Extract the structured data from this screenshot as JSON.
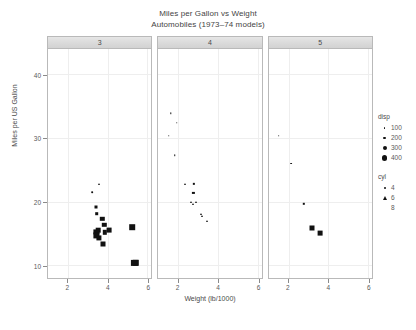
{
  "chart_data": {
    "type": "scatter",
    "title": "Miles per Gallon vs Weight",
    "subtitle": "Automobiles (1973–74 models)",
    "xlabel": "Weight (lb/1000)",
    "ylabel": "Miles per US Gallon",
    "xlim": [
      1.0,
      6.2
    ],
    "ylim": [
      8.0,
      44.0
    ],
    "xticks": [
      2,
      4,
      6
    ],
    "yticks": [
      0,
      10,
      20,
      30,
      40
    ],
    "grid": true,
    "facet_variable": "gear",
    "panels": [
      {
        "label": "3",
        "points": [
          {
            "x": 3.215,
            "y": 21.5,
            "cyl": 4,
            "disp": 120,
            "shape": "circle",
            "size": 1.7
          },
          {
            "x": 3.57,
            "y": 22.8,
            "cyl": 6,
            "disp": 141,
            "shape": "triangle",
            "size": 2.4
          },
          {
            "x": 3.44,
            "y": 19.2,
            "cyl": 6,
            "disp": 168,
            "shape": "square",
            "size": 3.0
          },
          {
            "x": 3.46,
            "y": 18.1,
            "cyl": 6,
            "disp": 225,
            "shape": "square",
            "size": 3.6
          },
          {
            "x": 3.73,
            "y": 17.3,
            "cyl": 8,
            "disp": 275,
            "shape": "square",
            "size": 4.4
          },
          {
            "x": 3.84,
            "y": 16.4,
            "cyl": 8,
            "disp": 275,
            "shape": "square",
            "size": 4.4
          },
          {
            "x": 3.845,
            "y": 15.2,
            "cyl": 8,
            "disp": 275,
            "shape": "square",
            "size": 4.4
          },
          {
            "x": 4.07,
            "y": 15.5,
            "cyl": 8,
            "disp": 318,
            "shape": "square",
            "size": 4.8
          },
          {
            "x": 3.52,
            "y": 15.5,
            "cyl": 8,
            "disp": 304,
            "shape": "square",
            "size": 4.6
          },
          {
            "x": 3.435,
            "y": 15.2,
            "cyl": 8,
            "disp": 360,
            "shape": "square",
            "size": 5.2
          },
          {
            "x": 3.44,
            "y": 14.7,
            "cyl": 8,
            "disp": 360,
            "shape": "square",
            "size": 5.2
          },
          {
            "x": 3.57,
            "y": 14.3,
            "cyl": 8,
            "disp": 360,
            "shape": "square",
            "size": 5.2
          },
          {
            "x": 3.78,
            "y": 13.3,
            "cyl": 8,
            "disp": 350,
            "shape": "square",
            "size": 5.0
          },
          {
            "x": 5.25,
            "y": 16.0,
            "cyl": 8,
            "disp": 440,
            "shape": "square",
            "size": 5.6
          },
          {
            "x": 5.424,
            "y": 10.4,
            "cyl": 8,
            "disp": 472,
            "shape": "square",
            "size": 6.4
          },
          {
            "x": 5.345,
            "y": 10.4,
            "cyl": 8,
            "disp": 460,
            "shape": "square",
            "size": 6.2
          }
        ]
      },
      {
        "label": "4",
        "points": [
          {
            "x": 1.615,
            "y": 33.9,
            "cyl": 4,
            "disp": 71,
            "shape": "circle",
            "size": 1.4
          },
          {
            "x": 1.935,
            "y": 32.4,
            "cyl": 4,
            "disp": 79,
            "shape": "circle",
            "size": 1.5
          },
          {
            "x": 1.513,
            "y": 30.4,
            "cyl": 4,
            "disp": 76,
            "shape": "circle",
            "size": 1.5
          },
          {
            "x": 1.835,
            "y": 27.3,
            "cyl": 4,
            "disp": 79,
            "shape": "circle",
            "size": 1.5
          },
          {
            "x": 2.78,
            "y": 22.8,
            "cyl": 4,
            "disp": 141,
            "shape": "square",
            "size": 2.3
          },
          {
            "x": 2.32,
            "y": 22.8,
            "cyl": 4,
            "disp": 108,
            "shape": "triangle",
            "size": 2.0
          },
          {
            "x": 2.77,
            "y": 21.4,
            "cyl": 4,
            "disp": 121,
            "shape": "square",
            "size": 2.2
          },
          {
            "x": 2.62,
            "y": 20.0,
            "cyl": 6,
            "disp": 160,
            "shape": "triangle",
            "size": 2.4
          },
          {
            "x": 2.875,
            "y": 20.0,
            "cyl": 6,
            "disp": 160,
            "shape": "triangle",
            "size": 2.4
          },
          {
            "x": 2.74,
            "y": 19.7,
            "cyl": 6,
            "disp": 145,
            "shape": "triangle",
            "size": 2.3
          },
          {
            "x": 3.15,
            "y": 18.1,
            "cyl": 6,
            "disp": 167,
            "shape": "triangle",
            "size": 2.5
          },
          {
            "x": 3.19,
            "y": 17.8,
            "cyl": 6,
            "disp": 167,
            "shape": "triangle",
            "size": 2.5
          },
          {
            "x": 3.44,
            "y": 17.0,
            "cyl": 6,
            "disp": 168,
            "shape": "triangle",
            "size": 2.5
          }
        ]
      },
      {
        "label": "5",
        "points": [
          {
            "x": 1.513,
            "y": 30.4,
            "cyl": 4,
            "disp": 95,
            "shape": "circle",
            "size": 1.6
          },
          {
            "x": 2.14,
            "y": 26.0,
            "cyl": 4,
            "disp": 120,
            "shape": "circle",
            "size": 1.8
          },
          {
            "x": 2.77,
            "y": 19.7,
            "cyl": 6,
            "disp": 145,
            "shape": "square",
            "size": 2.4
          },
          {
            "x": 3.17,
            "y": 15.8,
            "cyl": 8,
            "disp": 351,
            "shape": "square",
            "size": 5.0
          },
          {
            "x": 3.57,
            "y": 15.0,
            "cyl": 8,
            "disp": 301,
            "shape": "square",
            "size": 4.8
          }
        ]
      }
    ],
    "legends": [
      {
        "title": "disp",
        "type": "size",
        "entries": [
          {
            "label": "100",
            "size": 1.5
          },
          {
            "label": "200",
            "size": 2.8
          },
          {
            "label": "300",
            "size": 4.0
          },
          {
            "label": "400",
            "size": 5.4
          }
        ]
      },
      {
        "title": "cyl",
        "type": "shape",
        "entries": [
          {
            "label": "4",
            "shape": "circle"
          },
          {
            "label": "6",
            "shape": "triangle"
          },
          {
            "label": "8",
            "shape": "square"
          }
        ]
      }
    ]
  }
}
